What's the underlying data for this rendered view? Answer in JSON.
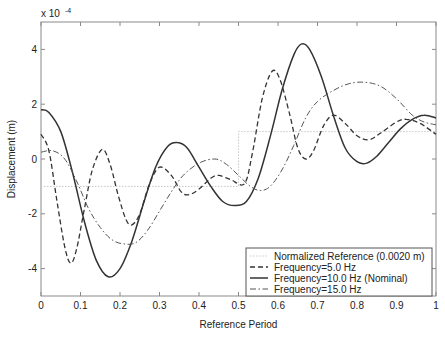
{
  "chart_data": {
    "type": "line",
    "title": "",
    "xlabel": "Reference Period",
    "ylabel": "Displacement (m)",
    "y_scale_note": "x 10",
    "y_scale_exponent": "-4",
    "xlim": [
      0,
      1
    ],
    "ylim": [
      -5,
      5
    ],
    "xticks": [
      0,
      0.1,
      0.2,
      0.3,
      0.4,
      0.5,
      0.6,
      0.7,
      0.8,
      0.9,
      1
    ],
    "xtick_labels": [
      "0",
      "0.1",
      "0.2",
      "0.3",
      "0.4",
      "0.5",
      "0.6",
      "0.7",
      "0.8",
      "0.9",
      "1"
    ],
    "yticks": [
      -4,
      -2,
      0,
      2,
      4
    ],
    "ytick_labels": [
      "-4",
      "-2",
      "0",
      "2",
      "4"
    ],
    "grid": false,
    "legend_position": "lower right",
    "series": [
      {
        "name": "Normalized Reference (0.0020 m)",
        "style": "dotted",
        "color": "#c8c8c8",
        "x": [
          0,
          0.5,
          0.5,
          1
        ],
        "y": [
          -1,
          -1,
          1,
          1
        ]
      },
      {
        "name": "Frequency=5.0 Hz",
        "style": "dashed",
        "color": "#333333",
        "x": [
          0,
          0.02,
          0.04,
          0.06,
          0.075,
          0.09,
          0.11,
          0.13,
          0.155,
          0.175,
          0.195,
          0.215,
          0.23,
          0.25,
          0.275,
          0.3,
          0.33,
          0.355,
          0.375,
          0.4,
          0.43,
          0.45,
          0.48,
          0.515,
          0.535,
          0.56,
          0.585,
          0.605,
          0.63,
          0.65,
          0.67,
          0.69,
          0.715,
          0.74,
          0.77,
          0.8,
          0.83,
          0.86,
          0.9,
          0.925,
          0.96,
          1.0
        ],
        "y": [
          0.9,
          0.3,
          -1.5,
          -3.2,
          -3.8,
          -3.3,
          -1.8,
          -0.4,
          0.35,
          -0.2,
          -1.3,
          -2.2,
          -2.4,
          -2.0,
          -0.9,
          -0.3,
          -0.6,
          -1.2,
          -1.3,
          -1.1,
          -0.7,
          -0.6,
          -0.75,
          -0.9,
          0.2,
          2.2,
          3.2,
          2.9,
          1.6,
          0.4,
          0.0,
          0.3,
          1.2,
          1.6,
          1.3,
          0.85,
          0.7,
          0.95,
          1.35,
          1.45,
          1.3,
          0.9
        ]
      },
      {
        "name": "Frequency=10.0 Hz (Nominal)",
        "style": "solid",
        "color": "#333333",
        "x": [
          0,
          0.02,
          0.05,
          0.08,
          0.11,
          0.14,
          0.17,
          0.2,
          0.23,
          0.26,
          0.29,
          0.32,
          0.345,
          0.37,
          0.4,
          0.43,
          0.46,
          0.49,
          0.52,
          0.55,
          0.58,
          0.61,
          0.64,
          0.66,
          0.68,
          0.71,
          0.74,
          0.77,
          0.8,
          0.825,
          0.85,
          0.88,
          0.91,
          0.94,
          0.97,
          1.0
        ],
        "y": [
          1.8,
          1.7,
          1.0,
          -0.5,
          -2.3,
          -3.7,
          -4.3,
          -4.0,
          -3.0,
          -1.6,
          -0.3,
          0.45,
          0.6,
          0.4,
          -0.3,
          -1.0,
          -1.55,
          -1.7,
          -1.55,
          -0.7,
          0.8,
          2.5,
          3.8,
          4.2,
          4.0,
          3.0,
          1.6,
          0.4,
          -0.1,
          -0.15,
          0.1,
          0.6,
          1.1,
          1.45,
          1.6,
          1.5
        ]
      },
      {
        "name": "Frequency=15.0 Hz",
        "style": "dashdot",
        "color": "#555555",
        "x": [
          0,
          0.03,
          0.06,
          0.09,
          0.12,
          0.15,
          0.18,
          0.21,
          0.24,
          0.27,
          0.3,
          0.33,
          0.36,
          0.4,
          0.44,
          0.47,
          0.5,
          0.53,
          0.555,
          0.58,
          0.61,
          0.64,
          0.67,
          0.7,
          0.74,
          0.78,
          0.82,
          0.86,
          0.9,
          0.94,
          0.97,
          1.0
        ],
        "y": [
          0.25,
          0.3,
          0.0,
          -0.8,
          -1.8,
          -2.5,
          -2.95,
          -3.1,
          -3.05,
          -2.6,
          -1.9,
          -1.2,
          -0.6,
          -0.15,
          0.0,
          -0.2,
          -0.6,
          -1.0,
          -1.15,
          -1.0,
          -0.4,
          0.5,
          1.5,
          2.1,
          2.5,
          2.75,
          2.8,
          2.65,
          2.2,
          1.6,
          1.35,
          1.25
        ]
      }
    ]
  },
  "legend": {
    "items": [
      "Normalized Reference (0.0020 m)",
      "Frequency=5.0 Hz",
      "Frequency=10.0 Hz (Nominal)",
      "Frequency=15.0 Hz"
    ]
  }
}
